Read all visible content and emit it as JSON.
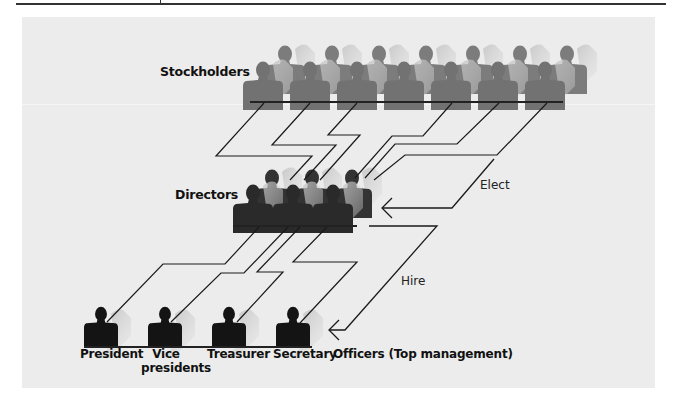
{
  "diagram": {
    "groups": {
      "stockholders": {
        "label": "Stockholders",
        "count": 14,
        "color": "#7a7a7a"
      },
      "directors": {
        "label": "Directors",
        "count": 6,
        "color": "#2e2e2e"
      },
      "officers": {
        "label": "Officers (Top management)",
        "color": "#151515",
        "members": [
          {
            "line1": "President",
            "line2": ""
          },
          {
            "line1": "Vice",
            "line2": "presidents"
          },
          {
            "line1": "Treasurer",
            "line2": ""
          },
          {
            "line1": "Secretary",
            "line2": ""
          }
        ]
      }
    },
    "arrows": {
      "elect": "Elect",
      "hire": "Hire"
    },
    "colors": {
      "panel": "#ececec",
      "line": "#1a1a1a",
      "shadow": "#bdbdbd"
    }
  }
}
